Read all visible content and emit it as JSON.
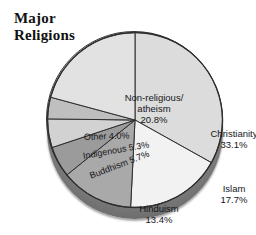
{
  "title": "Major\nReligions",
  "chart_data": {
    "type": "pie",
    "title": "Major Religions",
    "xlabel": "",
    "ylabel": "",
    "units": "percent of world population",
    "legend_position": "none (labels on slices)",
    "grid": false,
    "start_angle_deg": 0,
    "direction": "clockwise",
    "style": "3d-disc",
    "categories": [
      "Christianity",
      "Islam",
      "Hinduism",
      "Buddhism",
      "Indigenous",
      "Other",
      "Non-religious/atheism"
    ],
    "values": [
      33.1,
      17.7,
      13.4,
      5.7,
      5.3,
      4.0,
      20.8
    ],
    "slices": [
      {
        "name": "Christianity",
        "label": "Christianity",
        "value": 33.1,
        "value_label": "33.1%",
        "color": "#dcdcdc",
        "start_deg": 0.0,
        "end_deg": 119.16
      },
      {
        "name": "Islam",
        "label": "Islam",
        "value": 17.7,
        "value_label": "17.7%",
        "color": "#f2f2f2",
        "start_deg": 119.16,
        "end_deg": 182.88
      },
      {
        "name": "Hinduism",
        "label": "Hinduism",
        "value": 13.4,
        "value_label": "13.4%",
        "color": "#a9a9a9",
        "start_deg": 182.88,
        "end_deg": 231.12
      },
      {
        "name": "Buddhism",
        "label": "Buddhism",
        "value": 5.7,
        "value_label": "5.7%",
        "color": "#9b9b9b",
        "start_deg": 231.12,
        "end_deg": 251.64
      },
      {
        "name": "Indigenous",
        "label": "Indigenous",
        "value": 5.3,
        "value_label": "5.3%",
        "color": "#d2d2d2",
        "start_deg": 251.64,
        "end_deg": 270.72
      },
      {
        "name": "Other",
        "label": "Other",
        "value": 4.0,
        "value_label": "4.0%",
        "color": "#bfbfbf",
        "start_deg": 270.72,
        "end_deg": 285.12
      },
      {
        "name": "Non-religious/atheism",
        "label": "Non-religious/\natheism",
        "value": 20.8,
        "value_label": "20.8%",
        "color": "#e2e2e2",
        "start_deg": 285.12,
        "end_deg": 360.0
      }
    ],
    "colors": {
      "christianity": "#dcdcdc",
      "islam": "#f2f2f2",
      "hinduism": "#a9a9a9",
      "buddhism": "#9b9b9b",
      "indigenous": "#d2d2d2",
      "other": "#bfbfbf",
      "non_religious": "#e2e2e2",
      "outline": "#2e2e2e",
      "rim": "#b0b0b0",
      "depth_shadow": "#5a5a5a",
      "background": "#ffffff",
      "text": "#16161a"
    }
  },
  "labels": {
    "christianity": "Christianity\n33.1%",
    "islam": "Islam\n17.7%",
    "hinduism": "Hinduism\n13.4%",
    "non_religious": "Non-religious/\natheism\n20.8%",
    "other": "Other 4.0%",
    "indigenous": "Indigenous 5.3%",
    "buddhism": "Buddhism 5.7%"
  }
}
